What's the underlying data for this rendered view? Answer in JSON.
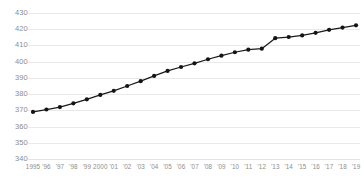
{
  "chart_data": {
    "type": "line",
    "title": "",
    "subtitle": "",
    "xlabel": "",
    "ylabel": "",
    "grid": true,
    "legend": false,
    "legend_position": "none",
    "line_color": "#1a1a1a",
    "marker_color": "#141414",
    "grid_color": "#e9e9e9",
    "tick_label_color": "#8d8d8d",
    "background_color": "#ffffff",
    "ylim": [
      340,
      430
    ],
    "ytick_step": 10,
    "ytick_values": [
      340,
      350,
      360,
      370,
      380,
      390,
      400,
      410,
      420,
      430
    ],
    "ytick_labels": [
      "340",
      "350",
      "360",
      "370",
      "380",
      "390",
      "400",
      "410",
      "420",
      "430"
    ],
    "x": [
      1995,
      1996,
      1997,
      1998,
      1999,
      2000,
      2001,
      2002,
      2003,
      2004,
      2005,
      2006,
      2007,
      2008,
      2009,
      2010,
      2011,
      2012,
      2013,
      2014,
      2015,
      2016,
      2017,
      2018,
      2019
    ],
    "xtick_labels": [
      "1995",
      "'96",
      "'97",
      "'98",
      "'99",
      "2000",
      "'01",
      "'02",
      "'03",
      "'04",
      "'05",
      "'06",
      "'07",
      "'08",
      "'09",
      "'10",
      "'11",
      "'12",
      "'13",
      "'14",
      "'15",
      "'16",
      "'17",
      "'18",
      "'19"
    ],
    "categories": [
      "1995",
      "'96",
      "'97",
      "'98",
      "'99",
      "2000",
      "'01",
      "'02",
      "'03",
      "'04",
      "'05",
      "'06",
      "'07",
      "'08",
      "'09",
      "'10",
      "'11",
      "'12",
      "'13",
      "'14",
      "'15",
      "'16",
      "'17",
      "'18",
      "'19"
    ],
    "values": [
      369.0,
      370.5,
      372.0,
      374.3,
      376.8,
      379.5,
      382.0,
      385.0,
      388.0,
      391.2,
      394.3,
      396.7,
      399.0,
      401.5,
      403.7,
      405.8,
      407.4,
      408.0,
      414.5,
      415.2,
      416.2,
      417.8,
      419.6,
      421.0,
      422.4
    ],
    "series": [
      {
        "name": "series-1",
        "values": [
          369.0,
          370.5,
          372.0,
          374.3,
          376.8,
          379.5,
          382.0,
          385.0,
          388.0,
          391.2,
          394.3,
          396.7,
          399.0,
          401.5,
          403.7,
          405.8,
          407.4,
          408.0,
          414.5,
          415.2,
          416.2,
          417.8,
          419.6,
          421.0,
          422.4
        ]
      }
    ]
  }
}
